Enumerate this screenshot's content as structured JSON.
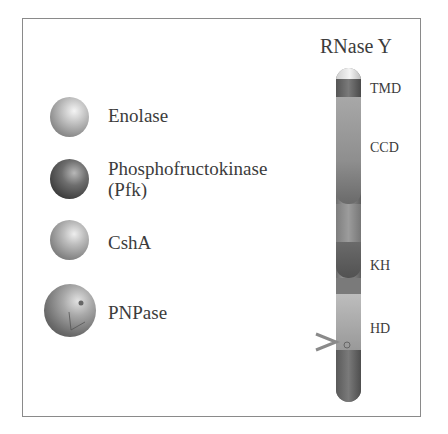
{
  "legend": {
    "items": [
      {
        "label": "Enolase",
        "shade": "light"
      },
      {
        "label": "Phosphofructokinase",
        "label2": "(Pfk)",
        "shade": "dark"
      },
      {
        "label": "CshA",
        "shade": "light"
      },
      {
        "label": "PNPase",
        "shade": "medium"
      }
    ]
  },
  "protein": {
    "title": "RNase Y",
    "domains": [
      "TMD",
      "CCD",
      "KH",
      "HD"
    ]
  }
}
